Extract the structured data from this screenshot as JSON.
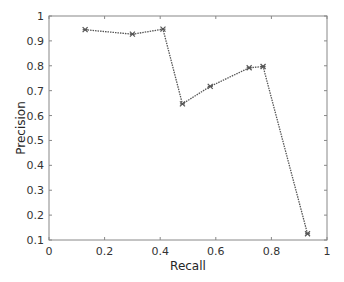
{
  "chart_data": {
    "type": "line",
    "title": "",
    "xlabel": "Recall",
    "ylabel": "Precision",
    "xlim": [
      0,
      1
    ],
    "ylim": [
      0.1,
      1
    ],
    "xticks": [
      0,
      0.2,
      0.4,
      0.6,
      0.8,
      1
    ],
    "xtick_labels": [
      "0",
      "0.2",
      "0.4",
      "0.6",
      "0.8",
      "1"
    ],
    "yticks": [
      0.1,
      0.2,
      0.3,
      0.4,
      0.5,
      0.6,
      0.7,
      0.8,
      0.9,
      1
    ],
    "ytick_labels": [
      "0.1",
      "0.2",
      "0.3",
      "0.4",
      "0.5",
      "0.6",
      "0.7",
      "0.8",
      "0.9",
      "1"
    ],
    "grid": false,
    "legend": null,
    "series": [
      {
        "name": "Precision-Recall",
        "color": "#555555",
        "line_style": "dotted",
        "marker": "asterisk",
        "x": [
          0.13,
          0.3,
          0.41,
          0.48,
          0.58,
          0.72,
          0.77,
          0.93
        ],
        "y": [
          0.945,
          0.927,
          0.947,
          0.647,
          0.717,
          0.792,
          0.797,
          0.125
        ]
      }
    ]
  },
  "colors": {
    "axis": "#888888",
    "text": "#333333",
    "line": "#555555",
    "background": "#ffffff"
  }
}
